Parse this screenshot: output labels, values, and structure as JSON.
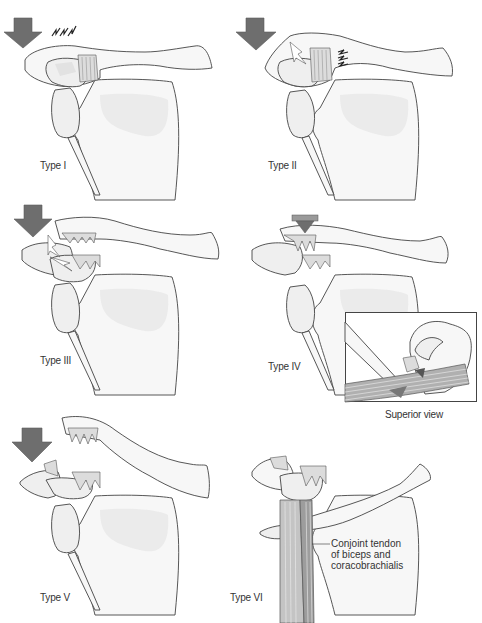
{
  "figure": {
    "caption": "",
    "arrow_color": "#6e6e6e",
    "bone_fill": "#f7f7f7",
    "outline_color": "#444444"
  },
  "panels": [
    {
      "id": "type-1",
      "label": "Type I",
      "arrow": "downward-force",
      "marks": "sprain-marks-above-acromion"
    },
    {
      "id": "type-2",
      "label": "Type II",
      "arrow": "downward-force",
      "marks": "sprain-marks-coracoclavicular"
    },
    {
      "id": "type-3",
      "label": "Type III",
      "arrow": "downward-force",
      "marks": "torn-ligaments"
    },
    {
      "id": "type-4",
      "label": "Type IV",
      "arrow": "posterior-force",
      "marks": "torn-ligaments"
    },
    {
      "id": "type-5",
      "label": "Type V",
      "arrow": "downward-force",
      "marks": "clavicle-displaced-superiorly"
    },
    {
      "id": "type-6",
      "label": "Type VI",
      "arrow": "",
      "marks": "clavicle-displaced-inferiorly"
    }
  ],
  "inset": {
    "label": "Superior view"
  },
  "callouts": {
    "conjoint_tendon": [
      "Conjoint tendon",
      "of biceps and",
      "coracobrachialis"
    ]
  }
}
